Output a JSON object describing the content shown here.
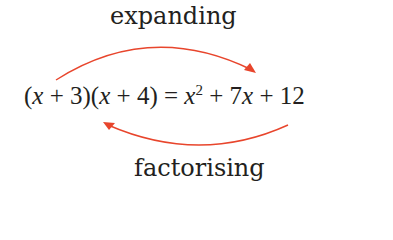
{
  "diagram": {
    "top_label": "expanding",
    "bottom_label": "factorising",
    "equation": {
      "lhs_parts": [
        "(",
        "x",
        " + 3)(",
        "x",
        " + 4)"
      ],
      "equals": " = ",
      "rhs_parts": [
        "x",
        "2",
        " + 7",
        "x",
        " + 12"
      ]
    },
    "arrow_color": "#e8452c",
    "arrows": [
      {
        "name": "expanding-arrow",
        "direction": "left-to-right",
        "position": "above"
      },
      {
        "name": "factorising-arrow",
        "direction": "right-to-left",
        "position": "below"
      }
    ]
  }
}
